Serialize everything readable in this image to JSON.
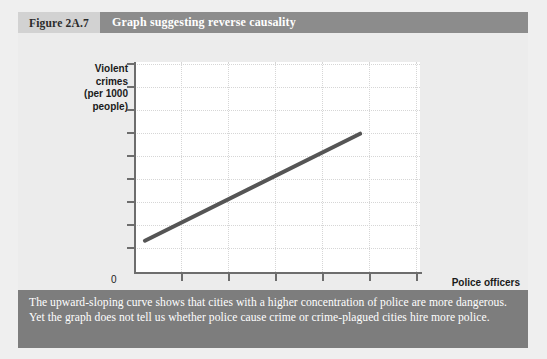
{
  "figure": {
    "number_label": "Figure 2A.7",
    "title": "Graph suggesting reverse causality",
    "caption": "The upward-sloping curve shows that cities with a higher concentration of police are more dangerous. Yet the graph does not tell us whether police cause crime or crime-plagued cities hire more police.",
    "colors": {
      "page_background": "#efefef",
      "panel_background": "#ececec",
      "number_band": "#d2d2d2",
      "title_band": "#8c8c8c",
      "caption_band": "#7d7d7d",
      "plot_background": "#ffffff",
      "axis": "#6d6d6d",
      "gridline": "#d6d6d6",
      "data_line": "#555555"
    }
  },
  "chart_data": {
    "type": "line",
    "title": "Graph suggesting reverse causality",
    "xlabel": "Police officers (per 1000 people)",
    "ylabel": "Violent crimes (per 1000 people)",
    "ylabel_lines": [
      "Violent",
      "crimes",
      "(per 1000",
      "people)"
    ],
    "xlabel_lines": [
      "Police officers",
      "(per 1000 people)"
    ],
    "origin_label": "0",
    "grid": true,
    "legend": null,
    "axis_tick_labels": {
      "x": [
        "",
        "",
        "",
        "",
        "",
        ""
      ],
      "y": [
        "",
        "",
        "",
        "",
        "",
        "",
        "",
        "",
        "",
        ""
      ]
    },
    "x_tick_count": 6,
    "y_tick_count": 10,
    "xlim": [
      0,
      1
    ],
    "ylim": [
      0,
      1
    ],
    "series": [
      {
        "name": "Violent crimes vs police officers",
        "points": [
          {
            "x": 0.038,
            "y": 0.165
          },
          {
            "x": 0.785,
            "y": 0.665
          }
        ]
      }
    ]
  }
}
